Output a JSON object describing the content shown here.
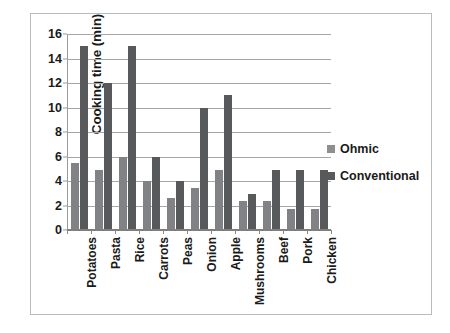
{
  "chart_data": {
    "type": "bar",
    "title": "",
    "subtitle": "",
    "xlabel": "",
    "ylabel": "Cooking time (min)",
    "ylim": [
      0,
      16
    ],
    "ytick_step": 2,
    "yticks": [
      "0",
      "2",
      "4",
      "6",
      "8",
      "10",
      "12",
      "14",
      "16"
    ],
    "grid": true,
    "legend_position": "right",
    "categories": [
      "Potatoes",
      "Pasta",
      "Rice",
      "Carrots",
      "Peas",
      "Onion",
      "Apple",
      "Mushrooms",
      "Beef",
      "Pork",
      "Chicken"
    ],
    "series": [
      {
        "name": "Ohmic",
        "color": "#808285",
        "values": [
          5.5,
          4.9,
          6.0,
          4.0,
          2.65,
          3.4,
          4.9,
          2.4,
          2.4,
          1.7,
          1.7
        ]
      },
      {
        "name": "Conventional",
        "color": "#58595b",
        "values": [
          15.0,
          12.0,
          15.0,
          6.0,
          4.0,
          10.0,
          11.0,
          2.9,
          4.9,
          4.9,
          4.9
        ]
      }
    ]
  },
  "legend": {
    "items": [
      {
        "label": "Ohmic",
        "swatch": "ohmic"
      },
      {
        "label": "Conventional",
        "swatch": "conv"
      }
    ]
  }
}
